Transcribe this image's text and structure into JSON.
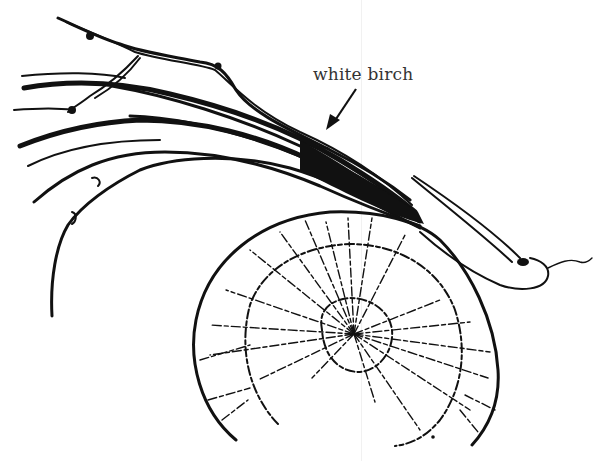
{
  "figure": {
    "label": "white birch",
    "ink_color": "#111111",
    "label_color": "#333333",
    "background": "#ffffff"
  }
}
